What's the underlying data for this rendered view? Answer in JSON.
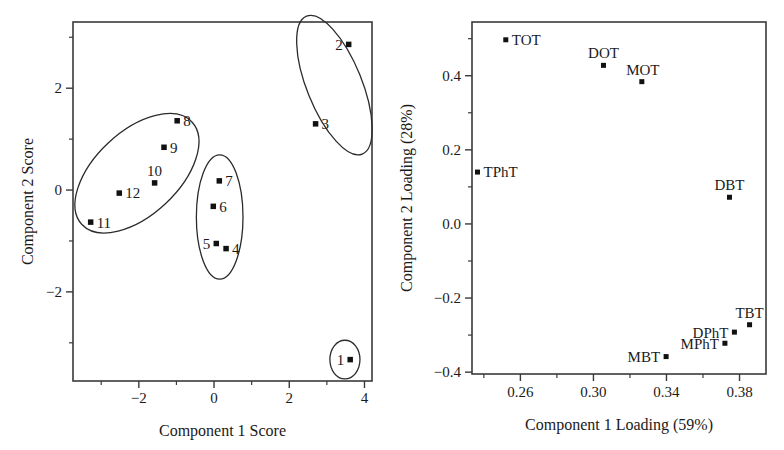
{
  "figure": {
    "background_color": "#ffffff",
    "ink_color": "#1a1a1a"
  },
  "chart_data": [
    {
      "id": "scores",
      "type": "scatter",
      "title": "",
      "xlabel": "Component 1 Score",
      "ylabel": "Component 2 Score",
      "xlim": [
        -3.75,
        4.2
      ],
      "ylim": [
        -3.75,
        3.3
      ],
      "grid": false,
      "legend": "none",
      "xticks": [
        -2,
        0,
        2,
        4
      ],
      "xticklabels": [
        "−2",
        "0",
        "2",
        "4"
      ],
      "xminorticks": [
        -3,
        -1,
        1,
        3
      ],
      "yticks": [
        -2,
        0,
        2
      ],
      "yticklabels": [
        "−2",
        "0",
        "2"
      ],
      "yminorticks": [
        -3,
        -1,
        1,
        3
      ],
      "points": [
        {
          "label": "1",
          "x": 3.62,
          "y": -3.33,
          "label_side": "left"
        },
        {
          "label": "2",
          "x": 3.58,
          "y": 2.86,
          "label_side": "left"
        },
        {
          "label": "3",
          "x": 2.7,
          "y": 1.3,
          "label_side": "right"
        },
        {
          "label": "4",
          "x": 0.32,
          "y": -1.15,
          "label_side": "right"
        },
        {
          "label": "5",
          "x": 0.06,
          "y": -1.05,
          "label_side": "left"
        },
        {
          "label": "6",
          "x": -0.02,
          "y": -0.32,
          "label_side": "right"
        },
        {
          "label": "7",
          "x": 0.14,
          "y": 0.18,
          "label_side": "right"
        },
        {
          "label": "8",
          "x": -0.98,
          "y": 1.36,
          "label_side": "right"
        },
        {
          "label": "9",
          "x": -1.33,
          "y": 0.84,
          "label_side": "right"
        },
        {
          "label": "10",
          "x": -1.58,
          "y": 0.14,
          "label_side": "above"
        },
        {
          "label": "11",
          "x": -3.28,
          "y": -0.63,
          "label_side": "right"
        },
        {
          "label": "12",
          "x": -2.52,
          "y": -0.06,
          "label_side": "right"
        }
      ],
      "clusters": [
        {
          "name": "cluster-left",
          "cx": -2.05,
          "cy": 0.33,
          "rx": 2.0,
          "ry": 0.82,
          "rotation": 43
        },
        {
          "name": "cluster-middle",
          "cx": 0.15,
          "cy": -0.53,
          "rx": 0.62,
          "ry": 1.22,
          "rotation": 0
        },
        {
          "name": "cluster-upper",
          "cx": 3.2,
          "cy": 2.06,
          "rx": 0.73,
          "ry": 1.46,
          "rotation": 22
        },
        {
          "name": "cluster-point1",
          "cx": 3.48,
          "cy": -3.33,
          "rx": 0.4,
          "ry": 0.38,
          "rotation": 0
        }
      ]
    },
    {
      "id": "loadings",
      "type": "scatter",
      "title": "",
      "xlabel": "Component 1 Loading (59%)",
      "ylabel": "Component 2 Loading (28%)",
      "xlim": [
        0.2335,
        0.3945
      ],
      "ylim": [
        -0.405,
        0.545
      ],
      "grid": false,
      "legend": "none",
      "xticks": [
        0.26,
        0.3,
        0.34,
        0.38
      ],
      "xticklabels": [
        "0.26",
        "0.30",
        "0.34",
        "0.38"
      ],
      "xminorticks": [
        0.24,
        0.28,
        0.32,
        0.36
      ],
      "yticks": [
        -0.4,
        -0.2,
        0.0,
        0.2,
        0.4
      ],
      "yticklabels": [
        "−0.4",
        "−0.2",
        "0.0",
        "0.2",
        "0.4"
      ],
      "yminorticks": [
        -0.3,
        -0.1,
        0.1,
        0.3,
        0.5
      ],
      "points": [
        {
          "label": "TOT",
          "x": 0.252,
          "y": 0.497,
          "label_side": "right"
        },
        {
          "label": "DOT",
          "x": 0.3055,
          "y": 0.428,
          "label_side": "above"
        },
        {
          "label": "MOT",
          "x": 0.3265,
          "y": 0.384,
          "label_side": "above-right"
        },
        {
          "label": "TPhT",
          "x": 0.2365,
          "y": 0.14,
          "label_side": "right"
        },
        {
          "label": "DBT",
          "x": 0.3745,
          "y": 0.072,
          "label_side": "above"
        },
        {
          "label": "TBT",
          "x": 0.3855,
          "y": -0.272,
          "label_side": "above"
        },
        {
          "label": "DPhT",
          "x": 0.3772,
          "y": -0.292,
          "label_side": "left"
        },
        {
          "label": "MPhT",
          "x": 0.372,
          "y": -0.322,
          "label_side": "left"
        },
        {
          "label": "MBT",
          "x": 0.3398,
          "y": -0.358,
          "label_side": "left"
        }
      ]
    }
  ]
}
